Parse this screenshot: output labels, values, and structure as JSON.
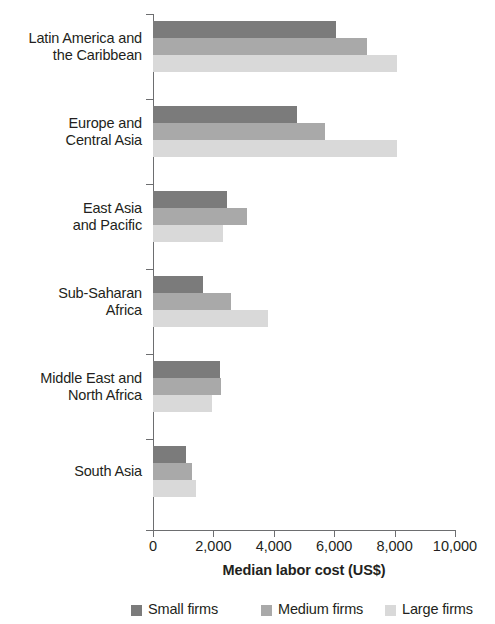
{
  "chart_data": {
    "type": "bar",
    "orientation": "horizontal",
    "title": "",
    "xlabel": "Median labor cost (US$)",
    "ylabel": "",
    "xlim": [
      0,
      10000
    ],
    "xticks": [
      0,
      2000,
      4000,
      6000,
      8000,
      10000
    ],
    "xtick_labels": [
      "0",
      "2,000",
      "4,000",
      "6,000",
      "8,000",
      "10,000"
    ],
    "grid": false,
    "legend_position": "bottom",
    "categories": [
      "Latin America and\nthe Caribbean",
      "Europe and\nCentral Asia",
      "East Asia\nand Pacific",
      "Sub-Saharan\nAfrica",
      "Middle East and\nNorth Africa",
      "South Asia"
    ],
    "series": [
      {
        "name": "Small firms",
        "color": "#7b7b7b",
        "values": [
          6050,
          4760,
          2460,
          1660,
          2210,
          1080
        ]
      },
      {
        "name": "Medium firms",
        "color": "#a9a9a9",
        "values": [
          7080,
          5680,
          3120,
          2570,
          2240,
          1280
        ]
      },
      {
        "name": "Large firms",
        "color": "#d9d9d9",
        "values": [
          8070,
          8090,
          2320,
          3820,
          1970,
          1410
        ]
      }
    ]
  },
  "legend": {
    "items": [
      {
        "label": "Small firms",
        "color": "#7b7b7b"
      },
      {
        "label": "Medium firms",
        "color": "#a9a9a9"
      },
      {
        "label": "Large firms",
        "color": "#d9d9d9"
      }
    ]
  },
  "axis": {
    "x_title": "Median labor cost (US$)"
  }
}
